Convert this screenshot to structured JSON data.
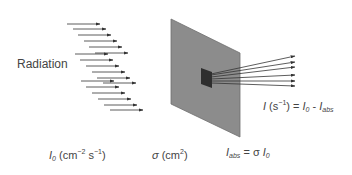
{
  "diagram": {
    "radiation_label": "Radiation",
    "incident_flux": {
      "symbol": "I",
      "subscript": "0",
      "units_prefix": " (cm",
      "exp1": "−2",
      "mid": " s",
      "exp2": "−1",
      "units_suffix": ")"
    },
    "cross_section": {
      "symbol": "σ",
      "units_prefix": " (cm",
      "exp": "2",
      "units_suffix": ")"
    },
    "absorbed": {
      "symbol": "I",
      "subscript": "abs",
      "equals": " = σ ",
      "rhs_symbol": "I",
      "rhs_subscript": "0"
    },
    "transmitted": {
      "symbol": "I",
      "units_prefix": " (s",
      "exp": "−1",
      "units_suffix": ") = ",
      "rhs1": "I",
      "rhs1_sub": "0",
      "minus": " - ",
      "rhs2": "I",
      "rhs2_sub": "abs"
    },
    "colors": {
      "panel": "#8c8c8c",
      "panel_edge": "#6e6e6e",
      "absorber": "#2e2e2e",
      "arrow": "#333333",
      "text": "#444444"
    }
  }
}
